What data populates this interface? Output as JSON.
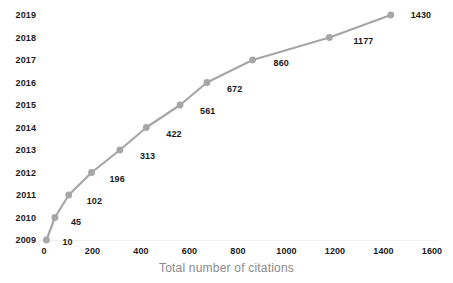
{
  "chart_data": {
    "type": "line",
    "title": "",
    "xlabel": "Total number of citations",
    "ylabel": "",
    "categories": [
      "2009",
      "2010",
      "2011",
      "2012",
      "2013",
      "2014",
      "2015",
      "2016",
      "2017",
      "2018",
      "2019"
    ],
    "values": [
      10,
      45,
      102,
      196,
      313,
      422,
      561,
      672,
      860,
      1177,
      1430
    ],
    "point_labels": [
      "10",
      "45",
      "102",
      "196",
      "313",
      "422",
      "561",
      "672",
      "860",
      "1177",
      "1430"
    ],
    "x_tick_labels": [
      "0",
      "200",
      "400",
      "600",
      "800",
      "1000",
      "1200",
      "1400",
      "1600"
    ],
    "x_tick_values": [
      0,
      200,
      400,
      600,
      800,
      1000,
      1200,
      1400,
      1600
    ],
    "y_tick_labels": [
      "2009",
      "2010",
      "2011",
      "2012",
      "2013",
      "2014",
      "2015",
      "2016",
      "2017",
      "2018",
      "2019"
    ],
    "xlim": [
      0,
      1600
    ],
    "grid": false,
    "legend": false,
    "series_color": "#a6a6a6",
    "marker_color": "#a6a6a6",
    "label_color": "#1a1a1a",
    "axis_title_color": "#8a8a8a"
  }
}
